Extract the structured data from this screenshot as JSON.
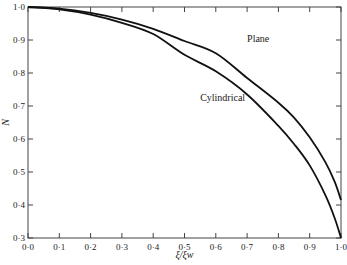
{
  "chart_data": {
    "type": "line",
    "title": "",
    "xlabel": "ξ/ξw",
    "ylabel": "N",
    "xlim": [
      0.0,
      1.0
    ],
    "ylim": [
      0.3,
      1.0
    ],
    "grid": false,
    "legend": "inline labels",
    "x_ticks": [
      "0·0",
      "0·1",
      "0·2",
      "0·3",
      "0·4",
      "0·5",
      "0·6",
      "0·7",
      "0·8",
      "0·9",
      "1·0"
    ],
    "y_ticks": [
      "0·3",
      "0·4",
      "0·5",
      "0·6",
      "0·7",
      "0·8",
      "0·9",
      "1·0"
    ],
    "series": [
      {
        "name": "Plane",
        "x": [
          0.0,
          0.1,
          0.2,
          0.3,
          0.4,
          0.5,
          0.6,
          0.7,
          0.8,
          0.85,
          0.9,
          0.95,
          0.98,
          1.0
        ],
        "y": [
          1.0,
          0.995,
          0.982,
          0.962,
          0.934,
          0.897,
          0.86,
          0.785,
          0.71,
          0.665,
          0.605,
          0.53,
          0.47,
          0.415
        ]
      },
      {
        "name": "Cylindrical",
        "x": [
          0.0,
          0.1,
          0.2,
          0.3,
          0.4,
          0.5,
          0.6,
          0.7,
          0.8,
          0.85,
          0.9,
          0.95,
          0.98,
          1.0
        ],
        "y": [
          1.0,
          0.993,
          0.977,
          0.952,
          0.918,
          0.855,
          0.805,
          0.735,
          0.64,
          0.585,
          0.52,
          0.43,
          0.36,
          0.3
        ]
      }
    ],
    "annotations": [
      {
        "text": "Plane",
        "x": 0.7,
        "y": 0.895
      },
      {
        "text": "Cylindrical",
        "x": 0.55,
        "y": 0.715
      }
    ]
  }
}
